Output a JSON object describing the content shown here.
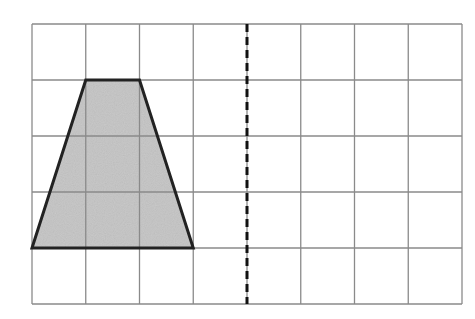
{
  "diagram": {
    "grid": {
      "columns": 8,
      "rows": 5,
      "origin_x": 32,
      "origin_y": 24,
      "cell_width": 53.75,
      "cell_height": 56,
      "line_color": "#8a8a8a"
    },
    "trapezoid": {
      "vertices_grid": [
        [
          1,
          1
        ],
        [
          2,
          1
        ],
        [
          3,
          4
        ],
        [
          0,
          4
        ]
      ],
      "fill": "#c4c4c4",
      "stroke": "#222222"
    },
    "mirror_line": {
      "grid_x": 4,
      "style": "dashed",
      "color": "#111111"
    }
  }
}
